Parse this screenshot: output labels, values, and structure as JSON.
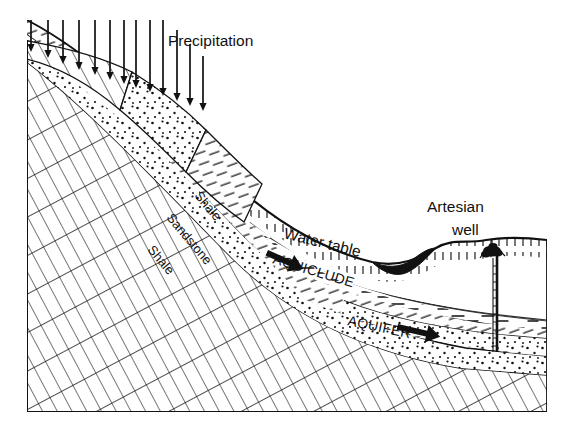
{
  "diagram": {
    "type": "geological-cross-section",
    "background_color": "#ffffff",
    "ink_color": "#000000",
    "frame": {
      "left": 27,
      "top": 40,
      "right": 547,
      "bottom": 412
    },
    "labels": {
      "precipitation": "Precipitation",
      "water_table": "Water table",
      "aquiclude": "AQUICLUDE",
      "aquifer": "AQUIFER",
      "artesian_well_line1": "Artesian",
      "artesian_well_line2": "well",
      "shale_upper": "Shale",
      "sandstone": "Sandstone",
      "shale_lower": "Shale"
    },
    "precipitation_arrows": {
      "count": 13,
      "direction": "down",
      "x_positions": [
        31,
        48,
        63,
        79,
        95,
        110,
        124,
        136,
        150,
        163,
        177,
        190,
        203
      ],
      "tip_y": [
        52,
        58,
        64,
        70,
        75,
        80,
        84,
        88,
        92,
        96,
        101,
        106,
        111
      ],
      "tail_length": 40
    },
    "flow_arrows": [
      {
        "name": "aquifer-flow-upper",
        "x": 286,
        "y": 260,
        "angle": 22,
        "length": 38
      },
      {
        "name": "aquifer-flow-lower",
        "x": 418,
        "y": 330,
        "angle": 12,
        "length": 42
      }
    ],
    "well": {
      "pipe_x": 497,
      "pipe_top_y": 256,
      "pipe_bottom_y": 352,
      "spray_cx": 493,
      "spray_cy": 251
    },
    "layers": [
      {
        "name": "shale-basement",
        "pattern": "cross-hatch-dense",
        "label": "Shale"
      },
      {
        "name": "sandstone-aquifer",
        "pattern": "stipple",
        "label": "Sandstone"
      },
      {
        "name": "shale-aquiclude",
        "pattern": "dash-hatch",
        "label": "Shale"
      },
      {
        "name": "surface-soil",
        "pattern": "tick-hatch",
        "label": "Water table"
      }
    ]
  }
}
